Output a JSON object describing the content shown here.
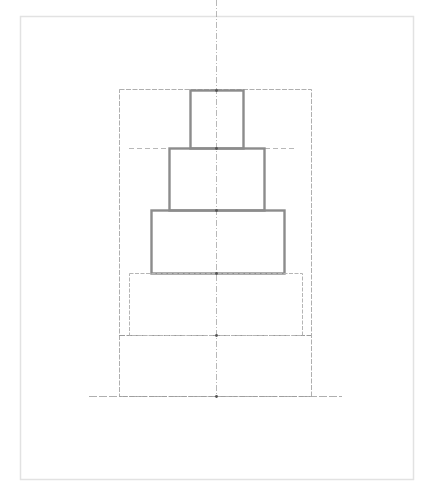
{
  "diagram": {
    "type": "construction-sketch",
    "canvas": {
      "width": 435,
      "height": 496,
      "background": "#ffffff"
    },
    "colors": {
      "frame": "#e2e2e2",
      "guide": "#9a9a9a",
      "tier_stroke": "#8c8c8c",
      "dashed_tier": "#b5b5b5",
      "node": "#555555"
    },
    "outer_frame": {
      "x": 20,
      "y": 16,
      "w": 393,
      "h": 463
    },
    "bounding_box": {
      "x": 119,
      "y": 89,
      "w": 192,
      "h": 307
    },
    "center_axis": {
      "x": 216,
      "y1": 30,
      "y2": 398
    },
    "ground_line": {
      "y": 396,
      "x1": 89,
      "x2": 342
    },
    "base_line": {
      "y": 335,
      "x1": 119,
      "x2": 311
    },
    "horizontal_guides": [
      {
        "y": 148,
        "x1": 129,
        "x2": 296
      }
    ],
    "tiers": [
      {
        "name": "tier-top",
        "x": 190,
        "y": 90,
        "w": 53,
        "h": 58,
        "style": "solid"
      },
      {
        "name": "tier-second",
        "x": 169,
        "y": 148,
        "w": 95,
        "h": 62,
        "style": "solid"
      },
      {
        "name": "tier-third",
        "x": 151,
        "y": 210,
        "w": 133,
        "h": 63,
        "style": "solid"
      },
      {
        "name": "tier-bottom",
        "x": 129,
        "y": 273,
        "w": 173,
        "h": 62,
        "style": "dashed"
      }
    ],
    "nodes": [
      {
        "x": 216,
        "y": 90
      },
      {
        "x": 216,
        "y": 148
      },
      {
        "x": 216,
        "y": 210
      },
      {
        "x": 216,
        "y": 273
      },
      {
        "x": 216,
        "y": 335
      },
      {
        "x": 216,
        "y": 396
      }
    ]
  }
}
